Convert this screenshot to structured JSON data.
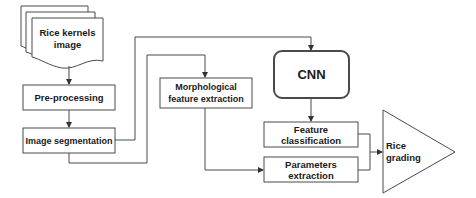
{
  "diagram": {
    "type": "flowchart",
    "colors": {
      "stroke": "#4a4a4a",
      "text": "#1a1a1a",
      "background": "#ffffff"
    },
    "nodes": [
      {
        "id": "input",
        "shape": "multi-document",
        "label": "Rice kernels image"
      },
      {
        "id": "preprocessing",
        "shape": "rectangle",
        "label": "Pre-processing"
      },
      {
        "id": "segmentation",
        "shape": "rectangle",
        "label": "Image segmentation"
      },
      {
        "id": "morph",
        "shape": "rectangle",
        "label": "Morphological feature extraction"
      },
      {
        "id": "cnn",
        "shape": "rounded-rectangle",
        "label": "CNN"
      },
      {
        "id": "classification",
        "shape": "rectangle",
        "label": "Feature classification"
      },
      {
        "id": "params",
        "shape": "rectangle",
        "label": "Parameters extraction"
      },
      {
        "id": "grading",
        "shape": "triangle",
        "label": "Rice grading"
      }
    ],
    "edges": [
      {
        "from": "input",
        "to": "preprocessing"
      },
      {
        "from": "preprocessing",
        "to": "segmentation"
      },
      {
        "from": "segmentation",
        "to": "cnn"
      },
      {
        "from": "segmentation",
        "to": "morph"
      },
      {
        "from": "cnn",
        "to": "classification"
      },
      {
        "from": "morph",
        "to": "params"
      },
      {
        "from": "classification",
        "to": "grading"
      },
      {
        "from": "params",
        "to": "grading"
      }
    ]
  },
  "labels": {
    "input_line1": "Rice kernels",
    "input_line2": "image",
    "preprocessing": "Pre-processing",
    "segmentation": "Image segmentation",
    "morph_line1": "Morphological",
    "morph_line2": "feature extraction",
    "cnn": "CNN",
    "classification_line1": "Feature",
    "classification_line2": "classification",
    "params_line1": "Parameters",
    "params_line2": "extraction",
    "grading_line1": "Rice",
    "grading_line2": "grading"
  }
}
